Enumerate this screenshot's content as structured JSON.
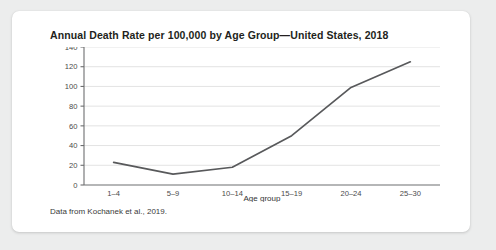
{
  "card": {
    "title": "Annual Death Rate per 100,000 by Age Group—United States, 2018",
    "caption": "Data from Kochanek et al., 2019."
  },
  "colors": {
    "background": "#eceded",
    "card": "#ffffff",
    "line": "#58595b",
    "gridline": "#e3e3e3",
    "axis": "#6d6e70",
    "text": "#231f20"
  },
  "chart_data": {
    "type": "line",
    "title": "Annual Death Rate per 100,000 by Age Group—United States, 2018",
    "xlabel": "Age group",
    "ylabel": "",
    "categories": [
      "1–4",
      "5–9",
      "10–14",
      "15–19",
      "20–24",
      "25–30"
    ],
    "values": [
      23,
      11,
      18,
      50,
      99,
      125
    ],
    "ylim": [
      0,
      140
    ],
    "yticks": [
      0,
      20,
      40,
      60,
      80,
      100,
      120,
      140
    ],
    "grid": true,
    "legend": false,
    "series": [
      {
        "name": "Annual death rate per 100,000",
        "values": [
          23,
          11,
          18,
          50,
          99,
          125
        ]
      }
    ]
  }
}
